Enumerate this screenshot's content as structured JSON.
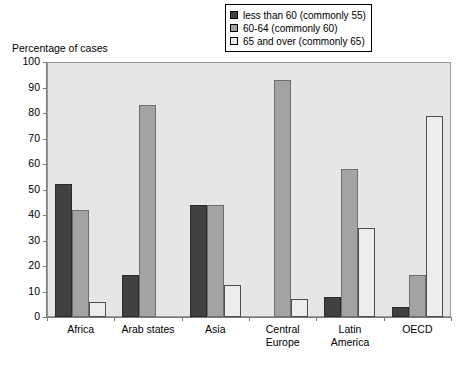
{
  "axis_title": "Percentage of cases",
  "legend": {
    "items": [
      {
        "label": "less than 60 (commonly 55)",
        "swatch": "#414141",
        "name": "legend-swatch-less-than-60"
      },
      {
        "label": "60-64 (commonly 60)",
        "swatch": "#a3a3a3",
        "name": "legend-swatch-60-64"
      },
      {
        "label": "65 and over (commonly 65)",
        "swatch": "#ededed",
        "name": "legend-swatch-65-and-over"
      }
    ]
  },
  "chart_data": {
    "type": "bar",
    "title": "",
    "xlabel": "",
    "ylabel": "Percentage of cases",
    "ylim": [
      0,
      100
    ],
    "ytick_step": 10,
    "yticks": [
      0,
      10,
      20,
      30,
      40,
      50,
      60,
      70,
      80,
      90,
      100
    ],
    "grid": false,
    "legend_position": "top-right",
    "categories": [
      "Africa",
      "Arab states",
      "Asia",
      "Central Europe",
      "Latin America",
      "OECD"
    ],
    "category_lines": [
      [
        "Africa"
      ],
      [
        "Arab states"
      ],
      [
        "Asia"
      ],
      [
        "Central",
        "Europe"
      ],
      [
        "Latin",
        "America"
      ],
      [
        "OECD"
      ]
    ],
    "series": [
      {
        "name": "less than 60 (commonly 55)",
        "color": "#414141",
        "values": [
          52,
          16.5,
          44,
          0,
          8,
          4
        ]
      },
      {
        "name": "60-64 (commonly 60)",
        "color": "#a3a3a3",
        "values": [
          42,
          83,
          44,
          93,
          58,
          16.5
        ]
      },
      {
        "name": "65 and over (commonly 65)",
        "color": "#ededed",
        "values": [
          6,
          0,
          12.5,
          7,
          35,
          79
        ]
      }
    ]
  }
}
